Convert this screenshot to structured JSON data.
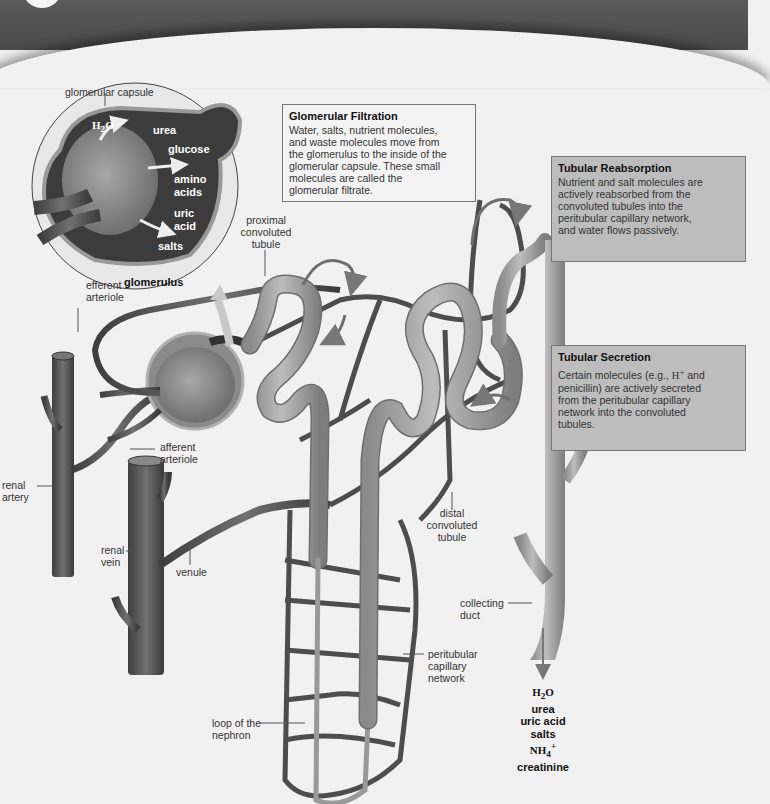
{
  "figure": {
    "type": "nephron-diagram",
    "colors": {
      "banner": "#4f4f4f",
      "background": "#f1f1f1",
      "tubule": "#a5a5a5",
      "capillary": "#555555",
      "capsule_dark": "#3c3c3c",
      "reabsorption_box": "#bdbdbd",
      "secretion_box": "#bdbdbd",
      "filtration_box": "#f3f3f3"
    }
  },
  "inset": {
    "caption_top": "glomerular capsule",
    "caption_bottom": "glomerulus",
    "molecules": {
      "water_html": "H<sub>2</sub>O",
      "urea": "urea",
      "glucose": "glucose",
      "amino_1": "amino",
      "amino_2": "acids",
      "uric_1": "uric",
      "uric_2": "acid",
      "salts": "salts"
    }
  },
  "boxes": {
    "filtration": {
      "title": "Glomerular Filtration",
      "lines": [
        "Water, salts, nutrient molecules,",
        "and waste molecules move from",
        "the glomerulus to the inside of the",
        "glomerular capsule. These small",
        "molecules are called the",
        "glomerular filtrate."
      ]
    },
    "reabsorption": {
      "title": "Tubular Reabsorption",
      "lines": [
        "Nutrient and salt molecules are",
        "actively reabsorbed from the",
        "convoluted tubules into the",
        "peritubular capillary network,",
        "and water flows passively."
      ]
    },
    "secretion": {
      "title": "Tubular Secretion",
      "lines_html": [
        "Certain molecules (e.g., <span class='serif'>H<sup>+</sup></span> and",
        "penicillin) are actively secreted",
        "from the peritubular capillary",
        "network into the convoluted",
        "tubules."
      ]
    }
  },
  "labels": {
    "proximal": [
      "proximal",
      "convoluted",
      "tubule"
    ],
    "efferent": [
      "efferent",
      "arteriole"
    ],
    "afferent": [
      "afferent",
      "arteriole"
    ],
    "renal_artery": [
      "renal",
      "artery"
    ],
    "renal_vein": [
      "renal",
      "vein"
    ],
    "venule": "venule",
    "distal": [
      "distal",
      "convoluted",
      "tubule"
    ],
    "collecting": [
      "collecting",
      "duct"
    ],
    "peritubular": [
      "peritubular",
      "capillary",
      "network"
    ],
    "loop": [
      "loop of the",
      "nephron"
    ]
  },
  "urine_output": {
    "items_html": [
      "<span class='serif'>H<sub>2</sub>O</span>",
      "urea",
      "uric acid",
      "salts",
      "<span class='serif'>NH<sub>4</sub><sup>+</sup></span>",
      "creatinine"
    ]
  }
}
